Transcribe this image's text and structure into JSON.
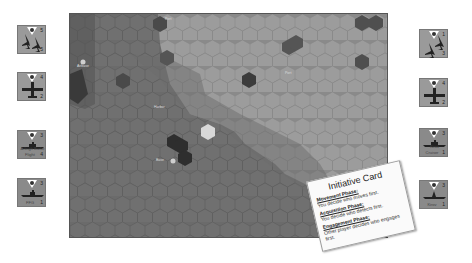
{
  "left_counters": [
    {
      "type": "fighter-pair",
      "top_value": "5",
      "bottom_value": "5"
    },
    {
      "type": "attack-aircraft",
      "top_value": "4",
      "bottom_value": "2"
    },
    {
      "type": "ship",
      "top_value": "3",
      "name": "Arleigh Burke",
      "sub": "Flight",
      "bottom_value": "4"
    },
    {
      "type": "ship",
      "top_value": "3",
      "name": "",
      "sub": "FFG",
      "bottom_value": "1"
    }
  ],
  "right_counters": [
    {
      "type": "fighter-pair",
      "top_value": "1",
      "bottom_value": "3"
    },
    {
      "type": "attack-aircraft",
      "top_value": "4",
      "bottom_value": "2"
    },
    {
      "type": "ship",
      "top_value": "3",
      "name": "Kirov",
      "sub": "Cruiser",
      "bottom_value": "1"
    },
    {
      "type": "ship",
      "top_value": "3",
      "name": "",
      "sub": "Kirov",
      "bottom_value": "1"
    }
  ],
  "map": {
    "labels": [
      {
        "text": "Airbase",
        "x": 7,
        "y": 50
      },
      {
        "text": "Port",
        "x": 95,
        "y": 3
      },
      {
        "text": "Port",
        "x": 215,
        "y": 57
      },
      {
        "text": "Harbor",
        "x": 84,
        "y": 91
      },
      {
        "text": "Base",
        "x": 86,
        "y": 144
      }
    ]
  },
  "initiative_card": {
    "title": "Initiative Card",
    "phases": [
      {
        "name": "Movement Phase:",
        "desc": "You decide who moves first."
      },
      {
        "name": "Acquisition Phase:",
        "desc": "You decide who detects first."
      },
      {
        "name": "Engagement Phase:",
        "desc": "Other player decides who engages first."
      }
    ]
  },
  "colors": {
    "land": "#6b6b6b",
    "sea": "#9c9c9c",
    "dark_hex": "#3a3a3a",
    "highlight_hex": "#d8d8d8"
  }
}
